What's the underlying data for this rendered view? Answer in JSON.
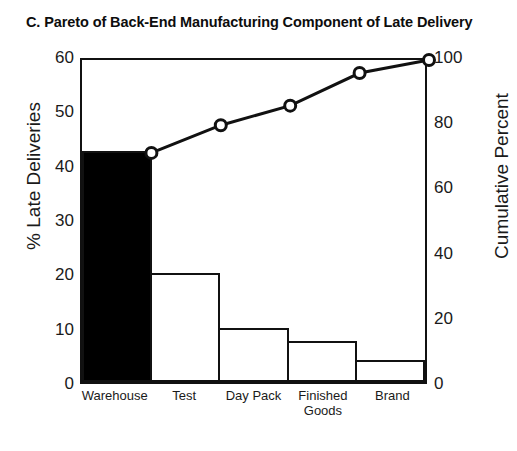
{
  "chart_data": {
    "type": "bar",
    "title": "C.  Pareto of Back-End Manufacturing Component of Late Delivery",
    "categories": [
      "Warehouse",
      "Test",
      "Day Pack",
      "Finished\nGoods",
      "Brand"
    ],
    "series": [
      {
        "name": "% Late Deliveries",
        "type": "bar",
        "values": [
          42.5,
          20,
          10,
          7.5,
          4
        ],
        "axis": "left",
        "highlight_index": 0,
        "highlight_color": "#000000",
        "bar_fill": "#ffffff",
        "bar_edge": "#111111"
      },
      {
        "name": "Cumulative Percent",
        "type": "line",
        "values": [
          71.5,
          80,
          86,
          96,
          100
        ],
        "axis": "right",
        "marker": "open-circle",
        "line_color": "#111111"
      }
    ],
    "xlabel": "",
    "ylabel": "% Late Deliveries",
    "ylabel_right": "Cumulative Percent",
    "ylim": [
      0,
      60
    ],
    "ylim_right": [
      0,
      100
    ],
    "yticks": [
      0,
      10,
      20,
      30,
      40,
      50,
      60
    ],
    "yticks_right": [
      0,
      20,
      40,
      60,
      80,
      100
    ],
    "grid": false,
    "legend": "none"
  },
  "axes": {
    "left": {
      "title": "% Late Deliveries",
      "ticks": [
        "0",
        "10",
        "20",
        "30",
        "40",
        "50",
        "60"
      ]
    },
    "right": {
      "title": "Cumulative Percent",
      "ticks": [
        "0",
        "20",
        "40",
        "60",
        "80",
        "100"
      ]
    }
  },
  "xcategories": [
    {
      "label": "Warehouse"
    },
    {
      "label": "Test"
    },
    {
      "label": "Day Pack"
    },
    {
      "label": "Finished\nGoods"
    },
    {
      "label": "Brand"
    }
  ],
  "header": {
    "title": "C.  Pareto of Back-End Manufacturing Component of Late Delivery"
  }
}
